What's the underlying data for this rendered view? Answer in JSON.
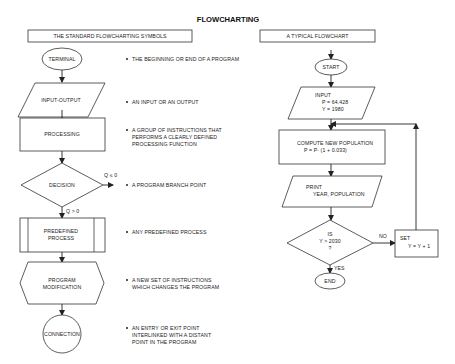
{
  "title": "FLOWCHARTING",
  "left_panel": {
    "header": "THE STANDARD FLOWCHARTING SYMBOLS",
    "symbols": [
      {
        "name": "TERMINAL",
        "shape": "ellipse",
        "description": [
          "THE BEGINNING OR END OF A PROGRAM"
        ]
      },
      {
        "name": "INPUT-OUTPUT",
        "shape": "parallelogram",
        "description": [
          "AN INPUT OR AN OUTPUT"
        ]
      },
      {
        "name": "PROCESSING",
        "shape": "rectangle",
        "description": [
          "A GROUP OF INSTRUCTIONS THAT",
          "PERFORMS A CLEARLY DEFINED",
          "PROCESSING FUNCTION"
        ]
      },
      {
        "name": "DECISION",
        "shape": "diamond",
        "description": [
          "A PROGRAM BRANCH POINT"
        ],
        "branch_right": "Q ≤ 0",
        "branch_down": "Q > 0"
      },
      {
        "name_lines": [
          "PREDEFINED",
          "PROCESS"
        ],
        "shape": "predefined-process",
        "description": [
          "ANY PREDEFINED PROCESS"
        ]
      },
      {
        "name_lines": [
          "PROGRAM",
          "MODIFICATION"
        ],
        "shape": "hexagon",
        "description": [
          "A NEW SET OF INSTRUCTIONS",
          "WHICH CHANGES THE PROGRAM"
        ]
      },
      {
        "name": "CONNECTION",
        "shape": "circle",
        "description": [
          "AN ENTRY OR EXIT POINT",
          "INTERLINKED WITH A DISTANT",
          "POINT IN THE PROGRAM"
        ]
      }
    ]
  },
  "right_panel": {
    "header": "A TYPICAL FLOWCHART",
    "start": "START",
    "input": {
      "label": "INPUT",
      "lines": [
        "P = 64.428",
        "Y = 1980"
      ]
    },
    "compute": {
      "label": "COMPUTE NEW POPULATION",
      "formula": "P = P· (1 + 0.033)"
    },
    "print": {
      "label": "PRINT",
      "line": "YEAR, POPULATION"
    },
    "decision": {
      "lines": [
        "IS",
        "Y > 2030",
        "?"
      ],
      "no_label": "NO",
      "yes_label": "YES"
    },
    "set": {
      "label": "SET",
      "formula": "Y = Y + 1"
    },
    "end": "END"
  }
}
